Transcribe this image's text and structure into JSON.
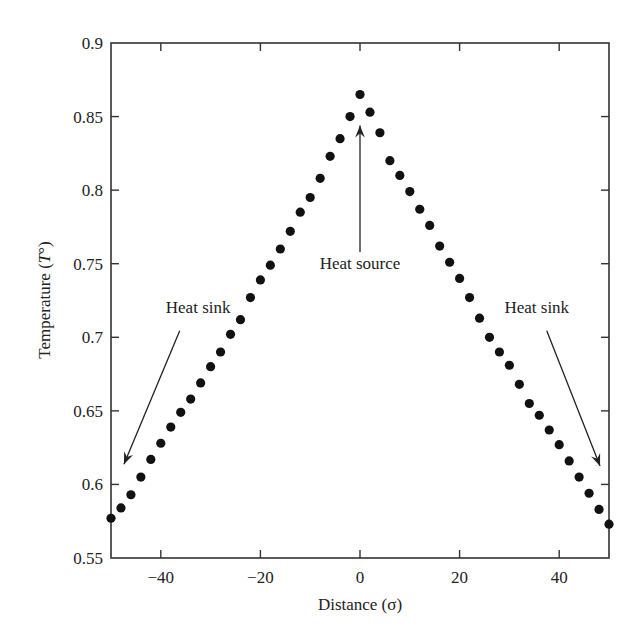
{
  "chart_data": {
    "type": "scatter",
    "title": "",
    "xlabel": "Distance (σ)",
    "ylabel": "Temperature (T°)",
    "ylabel_parts": {
      "text": "Temperature (",
      "italic": "T",
      "suffix": "°)"
    },
    "xlim": [
      -50,
      50
    ],
    "ylim": [
      0.55,
      0.9
    ],
    "grid": false,
    "legend": null,
    "x_ticks": [
      -40,
      -20,
      0,
      20,
      40
    ],
    "x_tick_labels": [
      "−40",
      "−20",
      "0",
      "20",
      "40"
    ],
    "y_ticks": [
      0.55,
      0.6,
      0.65,
      0.7,
      0.75,
      0.8,
      0.85,
      0.9
    ],
    "y_tick_labels": [
      "0.55",
      "0.6",
      "0.65",
      "0.7",
      "0.75",
      "0.8",
      "0.85",
      "0.9"
    ],
    "series": [
      {
        "name": "Temperature profile",
        "marker": "filled-circle",
        "color": "#111111",
        "x": [
          -50,
          -48,
          -46,
          -44,
          -42,
          -40,
          -38,
          -36,
          -34,
          -32,
          -30,
          -28,
          -26,
          -24,
          -22,
          -20,
          -18,
          -16,
          -14,
          -12,
          -10,
          -8,
          -6,
          -4,
          -2,
          0,
          2,
          4,
          6,
          8,
          10,
          12,
          14,
          16,
          18,
          20,
          22,
          24,
          26,
          28,
          30,
          32,
          34,
          36,
          38,
          40,
          42,
          44,
          46,
          48,
          50
        ],
        "y": [
          0.577,
          0.584,
          0.593,
          0.605,
          0.617,
          0.628,
          0.639,
          0.649,
          0.658,
          0.669,
          0.68,
          0.69,
          0.702,
          0.712,
          0.727,
          0.739,
          0.749,
          0.76,
          0.772,
          0.785,
          0.795,
          0.808,
          0.823,
          0.835,
          0.85,
          0.865,
          0.853,
          0.839,
          0.82,
          0.81,
          0.799,
          0.787,
          0.776,
          0.762,
          0.751,
          0.74,
          0.727,
          0.713,
          0.7,
          0.69,
          0.681,
          0.668,
          0.655,
          0.647,
          0.637,
          0.627,
          0.616,
          0.605,
          0.594,
          0.583,
          0.573
        ]
      }
    ],
    "annotations": [
      {
        "id": "heat-source",
        "text": "Heat source",
        "text_x": 0,
        "text_y": 0.7465,
        "arrow_from": [
          0,
          0.758
        ],
        "arrow_to": [
          0,
          0.844
        ]
      },
      {
        "id": "heat-sink-left",
        "text": "Heat sink",
        "text_x": -32.5,
        "text_y": 0.7165,
        "arrow_from": [
          -36.2,
          0.7045
        ],
        "arrow_to": [
          -47.4,
          0.6137
        ]
      },
      {
        "id": "heat-sink-right",
        "text": "Heat sink",
        "text_x": 35.5,
        "text_y": 0.7165,
        "arrow_from": [
          37.5,
          0.7045
        ],
        "arrow_to": [
          48.2,
          0.6125
        ]
      }
    ]
  }
}
